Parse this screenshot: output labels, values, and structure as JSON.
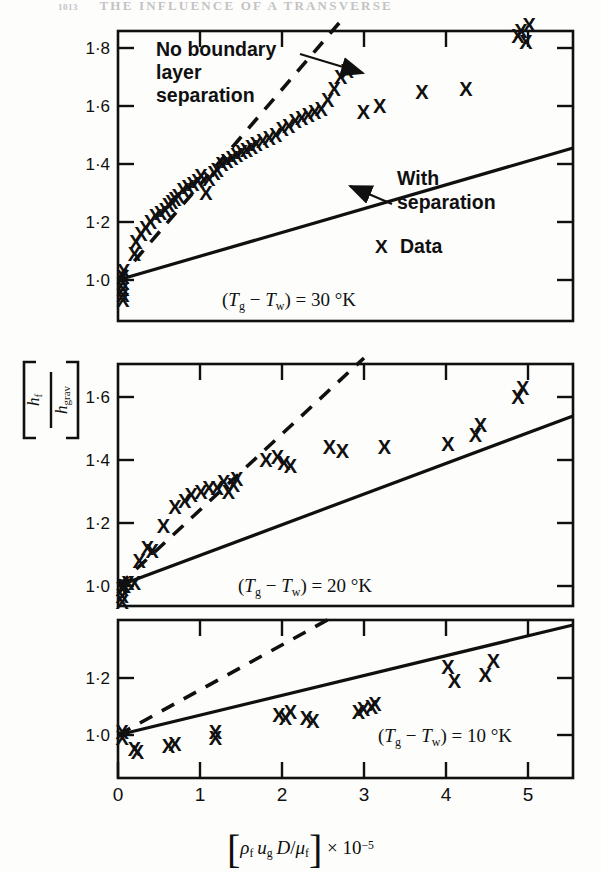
{
  "page": {
    "number": "1013",
    "running_head": "THE INFLUENCE OF A TRANSVERSE"
  },
  "figure": {
    "y_axis_label": {
      "numerator": "h",
      "numerator_sub": "f",
      "denominator": "h",
      "denominator_sub": "grav"
    },
    "x_axis_label": {
      "bracket_open": "[",
      "rho": "ρ",
      "rho_sub": "f",
      "u": "u",
      "u_sub": "g",
      "d": "D",
      "slash": "/",
      "mu": "μ",
      "mu_sub": "f",
      "bracket_close": "]",
      "times": "× 10",
      "exponent": "−5"
    },
    "marker_glyph": "X",
    "legend": {
      "data_label": "Data",
      "data_marker": "X"
    },
    "annotations": {
      "no_separation": "No boundary layer separation",
      "no_separation_line1": "No boundary",
      "no_separation_line2": "layer",
      "no_separation_line3": "separation",
      "with_separation_line1": "With",
      "with_separation_line2": "separation"
    },
    "colors": {
      "ink": "#101010",
      "paper": "#fdfdfb",
      "runhead": "#b9b9bc"
    }
  },
  "chart_data": [
    {
      "type": "scatter",
      "panel_index": 1,
      "title": "(Tg - Tw) = 30 K",
      "condition_text": "(T g − T w) = 30 °K",
      "condition_parts": {
        "open": "(",
        "t1": "T",
        "sub1": "g",
        "minus": "−",
        "t2": "T",
        "sub2": "w",
        "close": ")",
        "eq": "=",
        "value": "30",
        "unit": "°K"
      },
      "xlabel": "[ρf ug D/μf] × 10⁻⁵",
      "ylabel": "hf/hgrav",
      "xlim": [
        -0.18,
        5.6
      ],
      "ylim": [
        0.9,
        1.92
      ],
      "xticks": [
        0,
        1,
        2,
        3,
        4,
        5
      ],
      "xticklabels": [
        "",
        "",
        "",
        "",
        "",
        ""
      ],
      "yticks": [
        1.0,
        1.2,
        1.4,
        1.6,
        1.8
      ],
      "yticklabels": [
        "1·0",
        "1·2",
        "1·4",
        "1·6",
        "1·8"
      ],
      "grid": false,
      "lines": [
        {
          "name": "No boundary layer separation",
          "style": "dashed",
          "x": [
            0.0,
            2.72
          ],
          "y": [
            1.0,
            1.93
          ]
        },
        {
          "name": "With separation",
          "style": "solid",
          "x": [
            0.0,
            5.6
          ],
          "y": [
            1.0,
            1.66
          ]
        }
      ],
      "points": {
        "x": [
          0.06,
          0.06,
          0.06,
          0.06,
          0.06,
          0.07,
          0.2,
          0.22,
          0.28,
          0.34,
          0.4,
          0.46,
          0.52,
          0.58,
          0.62,
          0.66,
          0.7,
          0.74,
          0.8,
          0.86,
          0.92,
          0.98,
          1.02,
          1.08,
          1.12,
          1.18,
          1.22,
          1.28,
          1.34,
          1.4,
          1.46,
          1.52,
          1.58,
          1.64,
          1.7,
          1.78,
          1.86,
          1.94,
          2.02,
          2.1,
          2.18,
          2.26,
          2.34,
          2.42,
          2.5,
          2.58,
          2.66,
          2.74,
          2.82,
          3.02,
          3.22,
          3.74,
          4.28,
          4.92,
          4.96,
          5.02,
          5.06
        ],
        "y": [
          0.93,
          0.95,
          0.97,
          0.99,
          1.01,
          1.03,
          1.09,
          1.13,
          1.16,
          1.18,
          1.2,
          1.22,
          1.23,
          1.24,
          1.26,
          1.27,
          1.28,
          1.29,
          1.31,
          1.32,
          1.33,
          1.34,
          1.36,
          1.3,
          1.35,
          1.37,
          1.38,
          1.4,
          1.41,
          1.42,
          1.43,
          1.44,
          1.45,
          1.46,
          1.47,
          1.48,
          1.49,
          1.5,
          1.52,
          1.53,
          1.55,
          1.56,
          1.57,
          1.58,
          1.59,
          1.62,
          1.66,
          1.7,
          1.72,
          1.58,
          1.6,
          1.65,
          1.66,
          1.84,
          1.86,
          1.82,
          1.88
        ]
      },
      "annotations": [
        {
          "text": "No boundary layer separation",
          "x": 0.55,
          "y": 1.78,
          "arrow_to": {
            "x": 2.22,
            "y": 1.7
          }
        },
        {
          "text": "With separation",
          "x": 2.95,
          "y": 1.2,
          "arrow_to": {
            "x": 2.62,
            "y": 1.31
          }
        },
        {
          "text": "Data",
          "x": 2.98,
          "y": 1.1,
          "marker": "X"
        }
      ]
    },
    {
      "type": "scatter",
      "panel_index": 2,
      "title": "(Tg - Tw) = 20 K",
      "condition_text": "(T g − T w) = 20 °K",
      "condition_parts": {
        "open": "(",
        "t1": "T",
        "sub1": "g",
        "minus": "−",
        "t2": "T",
        "sub2": "w",
        "close": ")",
        "eq": "=",
        "value": "20",
        "unit": "°K"
      },
      "xlim": [
        -0.18,
        5.6
      ],
      "ylim": [
        0.93,
        1.73
      ],
      "xticks": [
        0,
        1,
        2,
        3,
        4,
        5
      ],
      "xticklabels": [
        "",
        "",
        "",
        "",
        "",
        ""
      ],
      "yticks": [
        1.0,
        1.2,
        1.4,
        1.6
      ],
      "yticklabels": [
        "1·0",
        "1·2",
        "1·4",
        "1·6"
      ],
      "grid": false,
      "lines": [
        {
          "name": "No boundary layer separation",
          "style": "dashed",
          "x": [
            0.0,
            3.02
          ],
          "y": [
            1.0,
            1.72
          ]
        },
        {
          "name": "With separation",
          "style": "solid",
          "x": [
            0.0,
            5.6
          ],
          "y": [
            1.0,
            1.54
          ]
        }
      ],
      "points": {
        "x": [
          0.05,
          0.05,
          0.05,
          0.06,
          0.08,
          0.12,
          0.2,
          0.26,
          0.36,
          0.42,
          0.56,
          0.7,
          0.82,
          0.9,
          1.02,
          1.12,
          1.22,
          1.3,
          1.36,
          1.42,
          1.46,
          1.82,
          1.96,
          2.04,
          2.12,
          2.6,
          2.76,
          3.28,
          4.06,
          4.4,
          4.46,
          4.92,
          4.98
        ],
        "y": [
          0.95,
          0.97,
          0.99,
          1.0,
          1.0,
          1.01,
          1.01,
          1.08,
          1.12,
          1.11,
          1.19,
          1.25,
          1.27,
          1.29,
          1.3,
          1.31,
          1.31,
          1.33,
          1.3,
          1.32,
          1.34,
          1.4,
          1.41,
          1.39,
          1.38,
          1.44,
          1.43,
          1.44,
          1.45,
          1.48,
          1.51,
          1.6,
          1.63
        ]
      }
    },
    {
      "type": "scatter",
      "panel_index": 3,
      "title": "(Tg - Tw) = 10 K",
      "condition_text": "(T g − T w) = 10 °K",
      "condition_parts": {
        "open": "(",
        "t1": "T",
        "sub1": "g",
        "minus": "−",
        "t2": "T",
        "sub2": "w",
        "close": ")",
        "eq": "=",
        "value": "10",
        "unit": "°K"
      },
      "xlim": [
        -0.18,
        5.6
      ],
      "ylim": [
        0.9,
        1.36
      ],
      "xticks": [
        0,
        1,
        2,
        3,
        4,
        5
      ],
      "xticklabels": [
        "0",
        "1",
        "2",
        "3",
        "4",
        "5"
      ],
      "yticks": [
        1.0,
        1.2
      ],
      "yticklabels": [
        "1·0",
        "1·2"
      ],
      "grid": false,
      "lines": [
        {
          "name": "No boundary layer separation",
          "style": "dashed",
          "x": [
            0.0,
            2.6
          ],
          "y": [
            1.0,
            1.34
          ]
        },
        {
          "name": "With separation",
          "style": "solid",
          "x": [
            0.0,
            5.6
          ],
          "y": [
            1.0,
            1.32
          ]
        }
      ],
      "points": {
        "x": [
          0.05,
          0.05,
          0.2,
          0.24,
          0.62,
          0.7,
          1.2,
          1.2,
          1.98,
          2.06,
          2.12,
          2.32,
          2.4,
          2.96,
          3.02,
          3.12,
          3.16,
          4.06,
          4.14,
          4.52,
          4.62
        ],
        "y": [
          1.01,
          0.99,
          0.95,
          0.94,
          0.96,
          0.97,
          0.99,
          1.01,
          1.07,
          1.06,
          1.08,
          1.06,
          1.05,
          1.08,
          1.09,
          1.1,
          1.11,
          1.24,
          1.19,
          1.21,
          1.26
        ]
      }
    }
  ]
}
